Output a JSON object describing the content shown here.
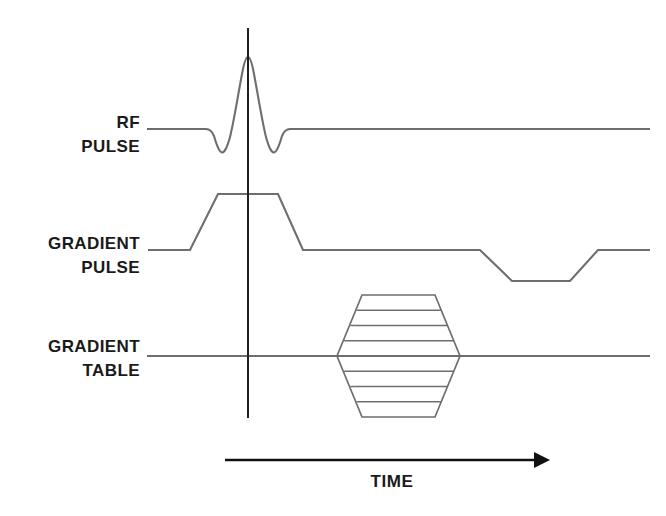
{
  "figure": {
    "type": "mri-pulse-sequence-diagram",
    "background_color": "#ffffff",
    "trace_color": "#6e6e6e",
    "axis_color": "#111111",
    "text_color": "#1a1a1a"
  },
  "rows": [
    {
      "id": "rf-pulse",
      "label_line1": "RF",
      "label_line2": "PULSE",
      "waveform": "sinc",
      "baseline_y": 129,
      "peak_y": 57,
      "sidelobe_y": 152,
      "start_x": 147,
      "end_x": 650
    },
    {
      "id": "gradient-pulse",
      "label_line1": "GRADIENT",
      "label_line2": "PULSE",
      "waveform": "trapezoid-with-negative-lobe",
      "baseline_y": 250,
      "plateau_y": 194,
      "negative_y": 281,
      "start_x": 148,
      "end_x": 650
    },
    {
      "id": "gradient-table",
      "label_line1": "GRADIENT",
      "label_line2": "TABLE",
      "waveform": "phase-encoding-hexagon",
      "baseline_y": 356,
      "start_x": 147,
      "end_x": 650
    }
  ],
  "gradient_table": {
    "shape": "hexagon",
    "center_x": 398.5,
    "center_y": 356,
    "half_width": 61,
    "half_height": 62,
    "top_half_width": 36,
    "step_count": 8,
    "rung_count": 7
  },
  "reference_line": {
    "name": "isocenter-reference-line",
    "x": 248,
    "y_top": 28,
    "y_bottom": 418
  },
  "time_axis": {
    "label": "TIME",
    "line_y": 460,
    "start_x": 225,
    "end_x": 550,
    "label_x": 392,
    "label_y": 483
  }
}
